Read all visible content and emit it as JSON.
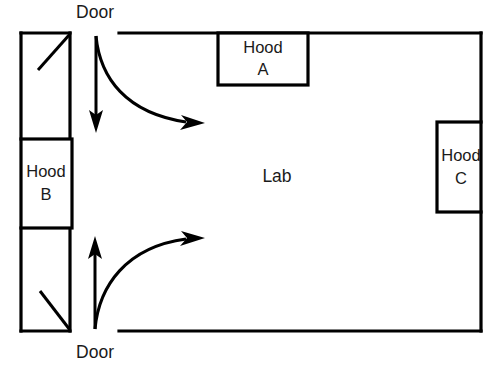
{
  "diagram": {
    "room": {
      "name": "Lab",
      "label": "Lab"
    },
    "doors": [
      {
        "id": "door-top",
        "label": "Door",
        "position": "top-left-wall"
      },
      {
        "id": "door-bottom",
        "label": "Door",
        "position": "bottom-left-wall"
      }
    ],
    "hoods": [
      {
        "id": "hood-a",
        "name": "Hood",
        "letter": "A",
        "wall": "top"
      },
      {
        "id": "hood-b",
        "name": "Hood",
        "letter": "B",
        "wall": "left"
      },
      {
        "id": "hood-c",
        "name": "Hood",
        "letter": "C",
        "wall": "right"
      }
    ],
    "airflow": [
      {
        "id": "flow-top-straight",
        "direction": "down",
        "origin": "door-top"
      },
      {
        "id": "flow-top-curved",
        "direction": "right",
        "origin": "door-top"
      },
      {
        "id": "flow-bottom-straight",
        "direction": "up",
        "origin": "door-bottom"
      },
      {
        "id": "flow-bottom-curved",
        "direction": "right",
        "origin": "door-bottom"
      }
    ],
    "colors": {
      "line": "#000000",
      "text": "#1a1a1a",
      "background": "#ffffff"
    }
  }
}
